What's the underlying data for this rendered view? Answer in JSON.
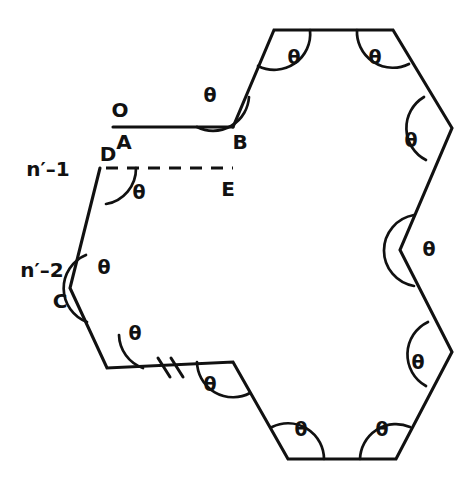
{
  "figure": {
    "type": "geometric-diagram",
    "canvas": {
      "width": 476,
      "height": 485
    },
    "stroke_color": "#111111",
    "background_color": "#ffffff",
    "angle_symbol": "θ",
    "vertex_labels": [
      {
        "id": "O",
        "text": "O",
        "x": 120,
        "y": 111
      },
      {
        "id": "A",
        "text": "A",
        "x": 124,
        "y": 143
      },
      {
        "id": "B",
        "text": "B",
        "x": 240,
        "y": 143
      },
      {
        "id": "D",
        "text": "D",
        "x": 108,
        "y": 155
      },
      {
        "id": "E",
        "text": "E",
        "x": 228,
        "y": 190
      },
      {
        "id": "C",
        "text": "C",
        "x": 60,
        "y": 302
      }
    ],
    "index_labels": [
      {
        "id": "n-minus-1",
        "text": "n′–1",
        "x": 48,
        "y": 170
      },
      {
        "id": "n-minus-2",
        "text": "n′–2",
        "x": 42,
        "y": 271
      }
    ],
    "theta_marks": [
      {
        "id": "theta-B",
        "x": 210,
        "y": 96
      },
      {
        "id": "theta-top-left",
        "x": 294,
        "y": 58
      },
      {
        "id": "theta-top-right",
        "x": 375,
        "y": 58
      },
      {
        "id": "theta-right-upper",
        "x": 411,
        "y": 141
      },
      {
        "id": "theta-right-middle",
        "x": 429,
        "y": 250
      },
      {
        "id": "theta-right-lower",
        "x": 418,
        "y": 363
      },
      {
        "id": "theta-bottom-right",
        "x": 382,
        "y": 430
      },
      {
        "id": "theta-bottom-left",
        "x": 301,
        "y": 430
      },
      {
        "id": "theta-lower-mid",
        "x": 210,
        "y": 385
      },
      {
        "id": "theta-lower-left",
        "x": 135,
        "y": 334
      },
      {
        "id": "theta-C",
        "x": 104,
        "y": 268
      },
      {
        "id": "theta-D",
        "x": 139,
        "y": 193
      }
    ],
    "polygon_points": "233,127 274,30 393,30 452,128 400,250 452,352 396,459 288,459 233,362 107,368 70,288 100,168",
    "ray_OA": {
      "x1": 113,
      "y1": 127,
      "x2": 233,
      "y2": 127
    },
    "dashed_DE": {
      "x1": 106,
      "y1": 168,
      "x2": 233,
      "y2": 168
    },
    "break_marks": [
      {
        "id": "break-tick-1",
        "x1": 158,
        "y1": 358,
        "x2": 170,
        "y2": 377
      },
      {
        "id": "break-tick-2",
        "x1": 170,
        "y1": 358,
        "x2": 182,
        "y2": 377
      }
    ],
    "arcs": [
      {
        "id": "arc-B",
        "d": "M 197,127 A 36,36 0 0 0 249,97"
      },
      {
        "id": "arc-top-left",
        "d": "M 258,66 A 36,36 0 0 0 310,30"
      },
      {
        "id": "arc-top-right",
        "d": "M 357,30 A 36,36 0 0 0 409,64"
      },
      {
        "id": "arc-right-upper",
        "d": "M 424,97 A 36,36 0 0 0 426,160"
      },
      {
        "id": "arc-right-middle",
        "d": "M 414,215 A 36,36 0 0 0 414,286"
      },
      {
        "id": "arc-right-lower",
        "d": "M 428,322 A 36,36 0 0 0 426,386"
      },
      {
        "id": "arc-bottom-right",
        "d": "M 410,427 A 36,36 0 0 0 360,459"
      },
      {
        "id": "arc-bottom-left",
        "d": "M 324,459 A 36,36 0 0 0 272,427"
      },
      {
        "id": "arc-lower-mid",
        "d": "M 197,362 A 36,36 0 0 0 250,393"
      },
      {
        "id": "arc-lower-left",
        "d": "M 119,335 A 36,36 0 0 0 143,368"
      },
      {
        "id": "arc-C",
        "d": "M 86,255 A 36,36 0 0 0 87,322"
      },
      {
        "id": "arc-D",
        "d": "M 106,204 A 36,36 0 0 0 136,168"
      }
    ]
  }
}
